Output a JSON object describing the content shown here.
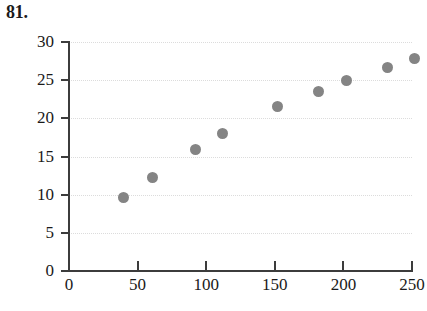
{
  "problem": {
    "number": "81."
  },
  "chart_data": {
    "type": "scatter",
    "title": "",
    "xlabel": "",
    "ylabel": "",
    "xlim": [
      0,
      250
    ],
    "ylim": [
      0,
      30
    ],
    "grid": true,
    "grid_axis": "y",
    "legend": "none",
    "marker": {
      "shape": "circle",
      "color": "#848484",
      "size_px": 11
    },
    "x_ticks": [
      0,
      50,
      100,
      150,
      200,
      250
    ],
    "y_ticks": [
      0,
      5,
      10,
      15,
      20,
      25,
      30
    ],
    "x_tick_labels": [
      "0",
      "50",
      "100",
      "150",
      "200",
      "250"
    ],
    "y_tick_labels": [
      "0",
      "5",
      "10",
      "15",
      "20",
      "25",
      "30"
    ],
    "x": [
      40,
      61,
      92,
      112,
      152,
      182,
      202,
      232,
      252
    ],
    "y": [
      9.6,
      12.3,
      15.9,
      18.0,
      21.5,
      23.5,
      25.0,
      26.7,
      27.8
    ],
    "points": [
      {
        "x": 40,
        "y": 9.6
      },
      {
        "x": 61,
        "y": 12.3
      },
      {
        "x": 92,
        "y": 15.9
      },
      {
        "x": 112,
        "y": 18.0
      },
      {
        "x": 152,
        "y": 21.5
      },
      {
        "x": 182,
        "y": 23.5
      },
      {
        "x": 202,
        "y": 25.0
      },
      {
        "x": 232,
        "y": 26.7
      },
      {
        "x": 252,
        "y": 27.8
      }
    ]
  },
  "colors": {
    "marker": "#848484",
    "axis": "#3c3c3c",
    "gridline": "#dcdcdc",
    "text": "#1a1a1a"
  }
}
